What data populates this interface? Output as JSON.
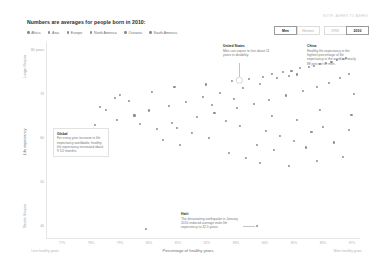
{
  "source_credit": "NOTE: ASHES TO ASHES",
  "title": "Numbers are averages for people born in 2010:",
  "legend": [
    {
      "label": "Africa",
      "color": "#8d8d8d"
    },
    {
      "label": "Asia",
      "color": "#8d8d8d"
    },
    {
      "label": "Europe",
      "color": "#8d8d8d"
    },
    {
      "label": "North America",
      "color": "#8d8d8d"
    },
    {
      "label": "Oceania",
      "color": "#8d8d8d"
    },
    {
      "label": "South America",
      "color": "#8d8d8d"
    }
  ],
  "toggles": {
    "sex": [
      {
        "label": "Men",
        "selected": true
      },
      {
        "label": "Women",
        "selected": false
      }
    ],
    "year": [
      {
        "label": "1990",
        "selected": false
      },
      {
        "label": "2010",
        "selected": true
      }
    ]
  },
  "axes": {
    "y_title": "Life expectancy",
    "y_top_note": "Longer lifespan",
    "y_bottom_note": "Shorter lifespan",
    "y_ticks": [
      "80 years",
      "70",
      "60",
      "50",
      "40"
    ],
    "x_title": "Percentage of healthy years",
    "x_left_note": "Less healthy years",
    "x_right_note": "More healthy years",
    "x_ticks": [
      "77%",
      "78%",
      "79%",
      "80%",
      "81%",
      "82%",
      "83%",
      "84%",
      "85%",
      "86%",
      "87%"
    ]
  },
  "annotations": {
    "united_states": {
      "title": "United States",
      "body": "Men can expect to live about 11 years in disability."
    },
    "china": {
      "title": "China",
      "body": "Healthy life expectancy is the highest percentage of life expectancy in the world, at nearly 88 percent for men."
    },
    "global": {
      "title": "Global",
      "body": "For every year increase in life expectancy worldwide, healthy life expectancy increased about 9 1/2 months."
    },
    "haiti": {
      "title": "Haiti",
      "body": "The devastating earthquake in January 2010 reduced average male life expectancy to 32.5 years."
    }
  },
  "chart_data": {
    "type": "scatter",
    "title": "Numbers are averages for people born in 2010:",
    "xlabel": "Percentage of healthy years",
    "ylabel": "Life expectancy",
    "xlim": [
      76.5,
      87.5
    ],
    "ylim": [
      30,
      85
    ],
    "grid": false,
    "legend_position": "top-left",
    "points": [
      {
        "x": 79.1,
        "y": 70.2
      },
      {
        "x": 80.2,
        "y": 71.0
      },
      {
        "x": 81.0,
        "y": 72.4
      },
      {
        "x": 78.4,
        "y": 66.8
      },
      {
        "x": 78.6,
        "y": 66.0
      },
      {
        "x": 82.1,
        "y": 73.1
      },
      {
        "x": 83.0,
        "y": 74.0
      },
      {
        "x": 83.6,
        "y": 74.6
      },
      {
        "x": 84.1,
        "y": 75.2
      },
      {
        "x": 84.4,
        "y": 76.0
      },
      {
        "x": 84.8,
        "y": 76.5
      },
      {
        "x": 85.1,
        "y": 77.0
      },
      {
        "x": 85.4,
        "y": 77.6
      },
      {
        "x": 85.7,
        "y": 78.0
      },
      {
        "x": 85.9,
        "y": 78.4
      },
      {
        "x": 86.1,
        "y": 78.8
      },
      {
        "x": 86.3,
        "y": 79.1
      },
      {
        "x": 86.5,
        "y": 79.5
      },
      {
        "x": 86.7,
        "y": 79.9
      },
      {
        "x": 86.9,
        "y": 80.2
      },
      {
        "x": 87.0,
        "y": 80.6
      },
      {
        "x": 85.0,
        "y": 75.4
      },
      {
        "x": 85.3,
        "y": 75.9
      },
      {
        "x": 84.6,
        "y": 74.8
      },
      {
        "x": 84.0,
        "y": 73.2
      },
      {
        "x": 83.4,
        "y": 72.0
      },
      {
        "x": 82.6,
        "y": 70.8
      },
      {
        "x": 82.0,
        "y": 69.6
      },
      {
        "x": 81.4,
        "y": 68.2
      },
      {
        "x": 80.8,
        "y": 67.0
      },
      {
        "x": 80.1,
        "y": 65.8
      },
      {
        "x": 79.6,
        "y": 64.4
      },
      {
        "x": 79.0,
        "y": 63.0
      },
      {
        "x": 78.2,
        "y": 61.6
      },
      {
        "x": 81.8,
        "y": 64.0
      },
      {
        "x": 82.4,
        "y": 65.2
      },
      {
        "x": 83.2,
        "y": 66.4
      },
      {
        "x": 83.8,
        "y": 67.6
      },
      {
        "x": 84.3,
        "y": 68.8
      },
      {
        "x": 84.9,
        "y": 70.0
      },
      {
        "x": 85.5,
        "y": 71.2
      },
      {
        "x": 86.0,
        "y": 72.4
      },
      {
        "x": 86.4,
        "y": 73.6
      },
      {
        "x": 86.8,
        "y": 74.8
      },
      {
        "x": 82.8,
        "y": 62.8
      },
      {
        "x": 83.3,
        "y": 61.4
      },
      {
        "x": 84.2,
        "y": 60.0
      },
      {
        "x": 84.7,
        "y": 58.6
      },
      {
        "x": 85.2,
        "y": 57.2
      },
      {
        "x": 85.8,
        "y": 59.8
      },
      {
        "x": 86.2,
        "y": 61.2
      },
      {
        "x": 83.9,
        "y": 56.0
      },
      {
        "x": 84.5,
        "y": 54.6
      },
      {
        "x": 85.6,
        "y": 55.4
      },
      {
        "x": 86.6,
        "y": 56.8
      },
      {
        "x": 82.2,
        "y": 58.0
      },
      {
        "x": 81.6,
        "y": 59.4
      },
      {
        "x": 80.4,
        "y": 60.6
      },
      {
        "x": 79.8,
        "y": 62.0
      },
      {
        "x": 80.6,
        "y": 57.4
      },
      {
        "x": 81.2,
        "y": 56.2
      },
      {
        "x": 82.9,
        "y": 53.8
      },
      {
        "x": 83.5,
        "y": 52.4
      },
      {
        "x": 84.0,
        "y": 51.0
      },
      {
        "x": 85.0,
        "y": 50.2
      },
      {
        "x": 86.0,
        "y": 51.6
      },
      {
        "x": 86.9,
        "y": 52.8
      },
      {
        "x": 87.1,
        "y": 60.4
      },
      {
        "x": 87.2,
        "y": 64.6
      },
      {
        "x": 87.3,
        "y": 70.4
      },
      {
        "x": 87.1,
        "y": 76.0
      },
      {
        "x": 79.4,
        "y": 68.4
      },
      {
        "x": 78.9,
        "y": 69.2
      },
      {
        "x": 80.9,
        "y": 62.2
      },
      {
        "x": 81.1,
        "y": 61.0
      },
      {
        "x": 82.3,
        "y": 67.4
      },
      {
        "x": 83.1,
        "y": 69.0
      },
      {
        "x": 84.4,
        "y": 64.2
      },
      {
        "x": 85.3,
        "y": 63.0
      },
      {
        "x": 86.1,
        "y": 66.0
      },
      {
        "x": 80.0,
        "y": 32.5
      }
    ],
    "highlighted": [
      {
        "name": "United States",
        "x": 84.5,
        "y": 76.3
      },
      {
        "name": "China",
        "x": 87.4,
        "y": 74.0
      },
      {
        "name": "Haiti",
        "x": 80.0,
        "y": 32.5
      }
    ]
  }
}
